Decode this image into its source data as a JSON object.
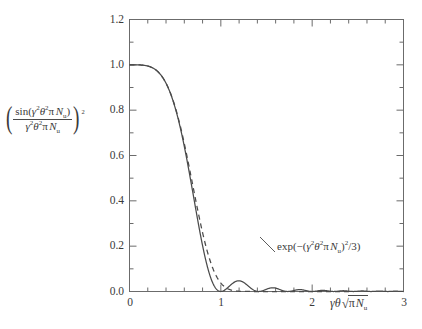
{
  "figure": {
    "background": "#ffffff",
    "line_color": "#4a4a4a",
    "axis_color": "#6b6b6b",
    "text_color": "#3a3a3a"
  },
  "axes": {
    "x": {
      "label_parts": {
        "gamma": "γ",
        "theta": "θ",
        "radical": "√",
        "radicand_pi": "π",
        "radicand_N": "N",
        "radicand_sub": "u"
      },
      "label_plain": "γθ√(πNᵤ)",
      "ticks": [
        "0",
        "1",
        "2",
        "3"
      ],
      "tick_values": [
        0,
        1,
        2,
        3
      ],
      "range": [
        0,
        3
      ],
      "minor_ticks_per_interval": 5
    },
    "y": {
      "label_plain": "(sin(γ²θ²πNᵤ)/(γ²θ²πNᵤ))²",
      "label_parts": {
        "open_paren": "(",
        "close_paren": ")",
        "numerator": {
          "sin": "sin(",
          "gamma": "γ",
          "gamma_exp": "2",
          "theta": "θ",
          "theta_exp": "2",
          "pi": "π",
          "N": "N",
          "N_sub": "u",
          "close": ")"
        },
        "denominator": {
          "gamma": "γ",
          "gamma_exp": "2",
          "theta": "θ",
          "theta_exp": "2",
          "pi": "π",
          "N": "N",
          "N_sub": "u"
        },
        "outer_exp": "2"
      },
      "ticks": [
        "0.0",
        "0.2",
        "0.4",
        "0.6",
        "0.8",
        "1.0",
        "1.2"
      ],
      "tick_values": [
        0.0,
        0.2,
        0.4,
        0.6,
        0.8,
        1.0,
        1.2
      ],
      "range": [
        0,
        1.2
      ],
      "minor_ticks_per_interval": 2
    }
  },
  "annotation": {
    "text_plain": "exp(−(γ²θ²πNᵤ)²/3)",
    "parts": {
      "exp": "exp(",
      "minus": "−",
      "open": "(",
      "gamma": "γ",
      "gamma_exp": "2",
      "theta": "θ",
      "theta_exp": "2",
      "pi": "π",
      "N": "N",
      "N_sub": "u",
      "close": ")",
      "sq": "2",
      "div3": "/3)"
    },
    "x": 2.18,
    "y": 0.215
  },
  "chart_data": {
    "type": "line",
    "title": "",
    "xlabel": "γθ√(πNᵤ)",
    "ylabel": "(sin(γ²θ²πNᵤ)/(γ²θ²πNᵤ))²",
    "xlim": [
      0,
      3
    ],
    "ylim": [
      0,
      1.2
    ],
    "grid": false,
    "legend": "none",
    "series": [
      {
        "name": "sinc-squared",
        "style": "solid",
        "formula": "(sin(x^2*pi/... ) / ... )^2 plotted as (sin(u)/u)^2 with u = x^2",
        "x": [
          0.0,
          0.1,
          0.2,
          0.3,
          0.4,
          0.5,
          0.6,
          0.7,
          0.8,
          0.9,
          1.0,
          1.1,
          1.2,
          1.3,
          1.4,
          1.5,
          1.6,
          1.7,
          1.75,
          1.8,
          1.9,
          2.0,
          2.1,
          2.17,
          2.25,
          2.35,
          2.45,
          2.55,
          2.65,
          2.72,
          2.8,
          2.9,
          3.0
        ],
        "y": [
          1.0,
          0.9999,
          0.9995,
          0.9976,
          0.9925,
          0.9818,
          0.9632,
          0.9345,
          0.8944,
          0.8424,
          0.7794,
          0.7076,
          0.6302,
          0.5508,
          0.4728,
          0.399,
          0.3316,
          0.2718,
          0.2446,
          0.2199,
          0.177,
          0.1425,
          0.115,
          0.099,
          0.081,
          0.063,
          0.047,
          0.032,
          0.02,
          0.014,
          0.009,
          0.004,
          0.002
        ]
      },
      {
        "name": "gaussian-approximation",
        "style": "dashed",
        "formula": "exp(-(x^2)^2/3)",
        "x": [
          0.0,
          0.1,
          0.2,
          0.3,
          0.4,
          0.5,
          0.6,
          0.7,
          0.8,
          0.9,
          1.0,
          1.1,
          1.2,
          1.3,
          1.4,
          1.5,
          1.6,
          1.7,
          1.8,
          1.9,
          2.0,
          2.1,
          2.2,
          2.3,
          2.4,
          2.5,
          3.0
        ],
        "y": [
          1.0,
          1.0,
          0.9999,
          0.9973,
          0.9915,
          0.9794,
          0.958,
          0.9242,
          0.876,
          0.813,
          0.7165,
          0.615,
          0.505,
          0.396,
          0.294,
          0.207,
          0.137,
          0.085,
          0.049,
          0.026,
          0.013,
          0.006,
          0.0025,
          0.001,
          0.0004,
          0.0001,
          0.0
        ]
      }
    ],
    "annotations": [
      {
        "text": "exp(−(γ²θ²πNᵤ)²/3)",
        "x": 2.18,
        "y": 0.215
      }
    ],
    "features": {
      "first_zero_x": 1.772,
      "first_sidelobe_peak_x": 2.17,
      "first_sidelobe_peak_y": 0.047,
      "second_zero_x": 2.507,
      "second_sidelobe_peak_x": 2.72,
      "second_sidelobe_peak_y": 0.016
    }
  }
}
